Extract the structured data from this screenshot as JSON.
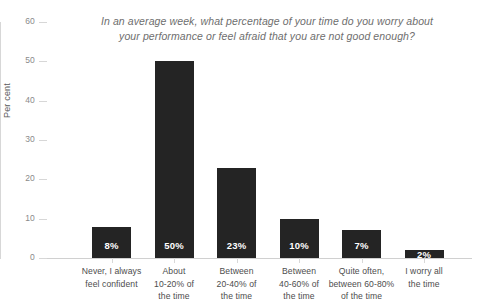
{
  "chart_data": {
    "type": "bar",
    "title": "In an average week, what percentage of your time do you worry about your performance or feel afraid that you are not good enough?",
    "title_lines": [
      "In an average week, what percentage of your time do you worry about",
      "your performance or feel afraid that you are not good enough?"
    ],
    "xlabel": "",
    "ylabel": "Per cent",
    "ylim": [
      0,
      60
    ],
    "yticks": [
      0,
      10,
      20,
      30,
      40,
      50,
      60
    ],
    "ytick_labels": [
      "0",
      "10",
      "20",
      "30",
      "40",
      "50",
      "60"
    ],
    "grid": false,
    "legend": false,
    "bar_color": "#242424",
    "value_label_color": "#ffffff",
    "axis_color": "#d7d7d7",
    "title_color": "#6e6e6e",
    "categories": [
      "Never, I always feel confident",
      "About 10-20% of the time",
      "Between 20-40% of the time",
      "Between 40-60% of the time",
      "Quite often, between 60-80% of the time",
      "I worry all the time"
    ],
    "category_lines": [
      [
        "Never, I always",
        "feel confident"
      ],
      [
        "About",
        "10-20% of",
        "the time"
      ],
      [
        "Between",
        "20-40% of",
        "the time"
      ],
      [
        "Between",
        "40-60% of",
        "the time"
      ],
      [
        "Quite often,",
        "between 60-80%",
        "of the time"
      ],
      [
        "I worry all",
        "the time"
      ]
    ],
    "values": [
      8,
      50,
      23,
      10,
      7,
      2
    ],
    "value_labels": [
      "8%",
      "50%",
      "23%",
      "10%",
      "7%",
      "2%"
    ]
  }
}
